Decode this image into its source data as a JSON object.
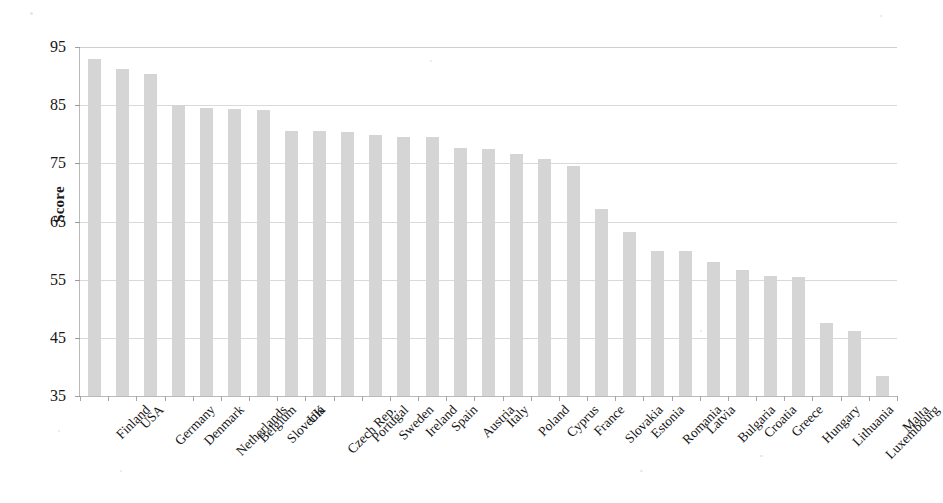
{
  "chart_data": {
    "type": "bar",
    "title": "",
    "xlabel": "",
    "ylabel": "Score",
    "ylim": [
      35,
      95
    ],
    "yticks": [
      35,
      45,
      55,
      65,
      75,
      85,
      95
    ],
    "grid": true,
    "legend": false,
    "bar_color": "#d5d5d5",
    "categories": [
      "Finland",
      "USA",
      "Germany",
      "Denmark",
      "Netherlands",
      "Belgium",
      "Slovenia",
      "UK",
      "Czech Rep.",
      "Portugal",
      "Sweden",
      "Ireland",
      "Spain",
      "Austria",
      "Italy",
      "Poland",
      "Cyprus",
      "France",
      "Slovakia",
      "Estonia",
      "Romania",
      "Latvia",
      "Bulgaria",
      "Croatia",
      "Greece",
      "Hungary",
      "Lithuania",
      "Luxembourg",
      "Malta"
    ],
    "values": [
      93.0,
      91.2,
      90.3,
      85.0,
      84.6,
      84.4,
      84.1,
      80.5,
      80.5,
      80.4,
      79.8,
      79.6,
      79.5,
      77.6,
      77.4,
      76.6,
      75.8,
      74.6,
      67.2,
      63.2,
      60.0,
      60.0,
      58.1,
      56.6,
      55.7,
      55.4,
      47.5,
      46.1,
      38.4
    ]
  }
}
